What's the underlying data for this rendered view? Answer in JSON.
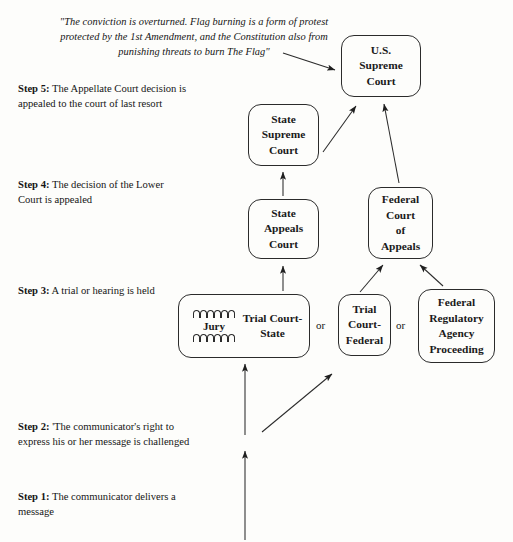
{
  "diagram": {
    "background_color": "#fdfdfb",
    "line_color": "#2b2b2b",
    "quote": "\"The conviction is overturned. Flag burning is a form of protest protected by the 1st Amendment, and the Constitution also from punishing threats to burn The Flag\"",
    "quote_lines": [
      "\"The conviction is overturned. Flag burning is a form of protest",
      "protected by the 1st Amendment, and the Constitution also",
      "from punishing threats to burn The Flag\""
    ],
    "steps": [
      {
        "id": "step-5",
        "label": "Step 5:",
        "text": "The Appellate Court decision is appealed to the court of last resort",
        "lines": [
          "The Appellate Court",
          "decision is appealed to the",
          "court of last resort"
        ]
      },
      {
        "id": "step-4",
        "label": "Step 4:",
        "text": "The decision of the Lower Court is appealed",
        "lines": [
          "The decision of the",
          "Lower Court is appealed"
        ]
      },
      {
        "id": "step-3",
        "label": "Step 3:",
        "text": "A trial or hearing is held",
        "lines": [
          "A trial or hearing is held"
        ]
      },
      {
        "id": "step-2",
        "label": "Step 2:",
        "text": "'The communicator's right to express his or her message is challenged",
        "lines": [
          "'The communicator's",
          "right to express his or her",
          "message is challenged"
        ]
      },
      {
        "id": "step-1",
        "label": "Step 1:",
        "text": "The communicator delivers a message",
        "lines": [
          "The communicator",
          "delivers a message"
        ]
      }
    ],
    "nodes": [
      {
        "id": "us-supreme-court",
        "name": "U.S. Supreme Court",
        "lines": [
          "U.S.",
          "Supreme",
          "Court"
        ]
      },
      {
        "id": "state-supreme-court",
        "name": "State Supreme Court",
        "lines": [
          "State",
          "Supreme",
          "Court"
        ]
      },
      {
        "id": "state-appeals-court",
        "name": "State Appeals Court",
        "lines": [
          "State",
          "Appeals",
          "Court"
        ]
      },
      {
        "id": "federal-court-of-appeals",
        "name": "Federal Court of Appeals",
        "lines": [
          "Federal",
          "Court",
          "of",
          "Appeals"
        ]
      },
      {
        "id": "trial-court-state",
        "name": "Trial Court-State",
        "lines": [
          "Trial Court-",
          "State"
        ],
        "jury_label": "Jury",
        "jury_seats_per_row": 6,
        "jury_rows": 2
      },
      {
        "id": "trial-court-federal",
        "name": "Trial Court-Federal",
        "lines": [
          "Trial",
          "Court-",
          "Federal"
        ]
      },
      {
        "id": "federal-regulatory-agency-proceeding",
        "name": "Federal Regulatory Agency Proceeding",
        "lines": [
          "Federal",
          "Regulatory",
          "Agency",
          "Proceeding"
        ]
      }
    ],
    "connectors": {
      "or_1": "or",
      "or_2": "or"
    },
    "arrows": [
      {
        "from": "quote",
        "to": "us-supreme-court"
      },
      {
        "from": "state-supreme-court",
        "to": "us-supreme-court"
      },
      {
        "from": "federal-court-of-appeals",
        "to": "us-supreme-court"
      },
      {
        "from": "state-appeals-court",
        "to": "state-supreme-court"
      },
      {
        "from": "trial-court-state",
        "to": "state-appeals-court"
      },
      {
        "from": "trial-court-federal",
        "to": "federal-court-of-appeals"
      },
      {
        "from": "federal-regulatory-agency-proceeding",
        "to": "federal-court-of-appeals"
      },
      {
        "from": "step-1",
        "to": "step-2"
      },
      {
        "from": "step-2",
        "to": "trial-court-state"
      },
      {
        "from": "step-2",
        "to": "trial-court-federal"
      }
    ]
  }
}
